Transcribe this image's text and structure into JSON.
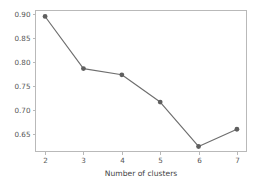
{
  "chart_data": {
    "type": "line",
    "title": "",
    "subtitle": "",
    "xlabel": "Number of clusters",
    "ylabel": "",
    "x": [
      2,
      3,
      4,
      5,
      6,
      7
    ],
    "values": [
      0.895,
      0.786,
      0.773,
      0.716,
      0.623,
      0.659
    ],
    "series": [
      {
        "name": "",
        "values": [
          0.895,
          0.786,
          0.773,
          0.716,
          0.623,
          0.659
        ]
      }
    ],
    "xtick_labels": [
      "2",
      "3",
      "4",
      "5",
      "6",
      "7"
    ],
    "ytick_labels": [
      "0.65",
      "0.70",
      "0.75",
      "0.80",
      "0.85",
      "0.90"
    ],
    "ytick_values": [
      0.65,
      0.7,
      0.75,
      0.8,
      0.85,
      0.9
    ],
    "xlim": [
      1.75,
      7.25
    ],
    "ylim": [
      0.6125,
      0.9075
    ],
    "grid": false,
    "legend": null,
    "legend_position": "none",
    "annotations": [],
    "marker": "circle",
    "line_color": "#6e6e6e",
    "marker_color": "#5f5f5f",
    "axis_color": "#b9b9b9",
    "tick_label_color": "#555555",
    "background_color": "#ffffff"
  }
}
